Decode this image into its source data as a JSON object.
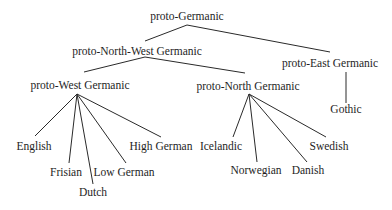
{
  "diagram": {
    "type": "tree",
    "title": "",
    "nodes": [
      {
        "id": "pg",
        "label": "proto-Germanic",
        "x": 187,
        "y": 20
      },
      {
        "id": "pnwg",
        "label": "proto-North-West Germanic",
        "x": 137,
        "y": 55
      },
      {
        "id": "peg",
        "label": "proto-East Germanic",
        "x": 330,
        "y": 67
      },
      {
        "id": "pwg",
        "label": "proto-West Germanic",
        "x": 80,
        "y": 89
      },
      {
        "id": "png",
        "label": "proto-North Germanic",
        "x": 248,
        "y": 90
      },
      {
        "id": "got",
        "label": "Gothic",
        "x": 346,
        "y": 113
      },
      {
        "id": "eng",
        "label": "English",
        "x": 34,
        "y": 150
      },
      {
        "id": "fri",
        "label": "Frisian",
        "x": 66,
        "y": 176
      },
      {
        "id": "dut",
        "label": "Dutch",
        "x": 93,
        "y": 196
      },
      {
        "id": "lg",
        "label": "Low German",
        "x": 124,
        "y": 176
      },
      {
        "id": "hg",
        "label": "High German",
        "x": 161,
        "y": 150
      },
      {
        "id": "ice",
        "label": "Icelandic",
        "x": 221,
        "y": 150
      },
      {
        "id": "nor",
        "label": "Norwegian",
        "x": 256,
        "y": 174
      },
      {
        "id": "dan",
        "label": "Danish",
        "x": 308,
        "y": 174
      },
      {
        "id": "swe",
        "label": "Swedish",
        "x": 329,
        "y": 150
      }
    ],
    "edges": [
      {
        "from": "pg",
        "to": "pnwg",
        "x1": 187,
        "y1": 25,
        "x2": 145,
        "y2": 41
      },
      {
        "from": "pg",
        "to": "peg",
        "x1": 187,
        "y1": 25,
        "x2": 330,
        "y2": 52
      },
      {
        "from": "pnwg",
        "to": "pwg",
        "x1": 145,
        "y1": 57,
        "x2": 84,
        "y2": 72
      },
      {
        "from": "pnwg",
        "to": "png",
        "x1": 145,
        "y1": 57,
        "x2": 245,
        "y2": 73
      },
      {
        "from": "peg",
        "to": "got",
        "x1": 346,
        "y1": 72,
        "x2": 346,
        "y2": 103
      },
      {
        "from": "pwg",
        "to": "eng",
        "x1": 77,
        "y1": 94,
        "x2": 35,
        "y2": 136
      },
      {
        "from": "pwg",
        "to": "fri",
        "x1": 77,
        "y1": 94,
        "x2": 69,
        "y2": 163
      },
      {
        "from": "pwg",
        "to": "dut",
        "x1": 77,
        "y1": 94,
        "x2": 93,
        "y2": 184
      },
      {
        "from": "pwg",
        "to": "lg",
        "x1": 77,
        "y1": 94,
        "x2": 126,
        "y2": 163
      },
      {
        "from": "pwg",
        "to": "hg",
        "x1": 77,
        "y1": 94,
        "x2": 161,
        "y2": 137
      },
      {
        "from": "png",
        "to": "ice",
        "x1": 249,
        "y1": 94,
        "x2": 233,
        "y2": 137
      },
      {
        "from": "png",
        "to": "nor",
        "x1": 249,
        "y1": 94,
        "x2": 257,
        "y2": 162
      },
      {
        "from": "png",
        "to": "dan",
        "x1": 249,
        "y1": 94,
        "x2": 307,
        "y2": 162
      },
      {
        "from": "png",
        "to": "swe",
        "x1": 249,
        "y1": 94,
        "x2": 326,
        "y2": 137
      }
    ],
    "colors": {
      "text": "#1e1e1e",
      "line": "#2a2a2a",
      "background": "#ffffff"
    }
  }
}
